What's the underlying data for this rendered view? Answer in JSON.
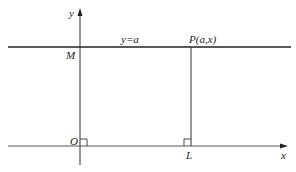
{
  "diagram": {
    "axes": {
      "x_label": "x",
      "y_label": "y",
      "origin_label": "O"
    },
    "line": {
      "equation_label": "y=a"
    },
    "points": {
      "M": "M",
      "P": "P(a,x)",
      "L": "L"
    },
    "colors": {
      "ink": "#222222",
      "background": "#ffffff"
    }
  }
}
